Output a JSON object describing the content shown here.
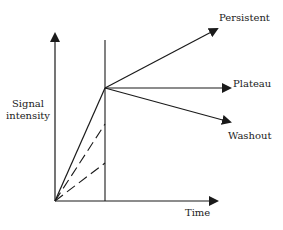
{
  "diagram": {
    "type": "signal-intensity time curve schematic",
    "y_axis_label": [
      "Signal",
      "intensity"
    ],
    "x_axis_label": "Time",
    "curves": [
      {
        "name": "Persistent",
        "label": "Persistent"
      },
      {
        "name": "Plateau",
        "label": "Plateau"
      },
      {
        "name": "Washout",
        "label": "Washout"
      }
    ],
    "colors": {
      "line": "#1a1a1a",
      "text": "#222222",
      "background": "#ffffff"
    }
  }
}
